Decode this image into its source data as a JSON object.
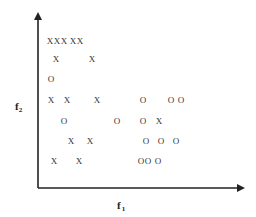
{
  "figure": {
    "x_axis_label": "f",
    "x_axis_subscript": "1",
    "y_axis_label": "f",
    "y_axis_subscript": "2"
  },
  "chart_data": {
    "type": "scatter",
    "title": "",
    "xlabel": "f1",
    "ylabel": "f2",
    "grid": false,
    "legend": "none",
    "axis_ticks": "none",
    "xlim": [
      0,
      10
    ],
    "ylim": [
      0,
      10
    ],
    "series": [
      {
        "name": "X",
        "marker": "x",
        "points": [
          {
            "x": 0.6,
            "y": 8.6
          },
          {
            "x": 1.0,
            "y": 8.6
          },
          {
            "x": 1.4,
            "y": 8.6
          },
          {
            "x": 2.3,
            "y": 8.6
          },
          {
            "x": 2.7,
            "y": 8.6
          },
          {
            "x": 1.0,
            "y": 7.6
          },
          {
            "x": 2.8,
            "y": 7.6
          },
          {
            "x": 0.7,
            "y": 5.4
          },
          {
            "x": 1.5,
            "y": 5.4
          },
          {
            "x": 3.0,
            "y": 5.4
          },
          {
            "x": 6.0,
            "y": 4.2
          },
          {
            "x": 1.7,
            "y": 3.0
          },
          {
            "x": 2.7,
            "y": 3.0
          },
          {
            "x": 0.9,
            "y": 1.9
          },
          {
            "x": 2.1,
            "y": 1.9
          }
        ]
      },
      {
        "name": "O",
        "marker": "o",
        "points": [
          {
            "x": 0.7,
            "y": 6.5
          },
          {
            "x": 5.3,
            "y": 5.4
          },
          {
            "x": 6.7,
            "y": 5.4
          },
          {
            "x": 7.2,
            "y": 5.4
          },
          {
            "x": 1.3,
            "y": 4.2
          },
          {
            "x": 4.0,
            "y": 4.2
          },
          {
            "x": 5.3,
            "y": 4.2
          },
          {
            "x": 5.4,
            "y": 3.0
          },
          {
            "x": 6.2,
            "y": 3.0
          },
          {
            "x": 6.9,
            "y": 3.0
          },
          {
            "x": 5.1,
            "y": 1.9
          },
          {
            "x": 5.5,
            "y": 1.9
          },
          {
            "x": 6.0,
            "y": 1.9
          }
        ]
      }
    ],
    "markers_px": [
      {
        "label": "x",
        "px": 50,
        "py": 44
      },
      {
        "label": "x",
        "px": 57,
        "py": 44
      },
      {
        "label": "x",
        "px": 64,
        "py": 44
      },
      {
        "label": "x",
        "px": 73,
        "py": 44
      },
      {
        "label": "x",
        "px": 80,
        "py": 44
      },
      {
        "label": "x",
        "px": 56,
        "py": 62
      },
      {
        "label": "x",
        "px": 92,
        "py": 62
      },
      {
        "label": "o",
        "px": 51,
        "py": 82
      },
      {
        "label": "x",
        "px": 51,
        "py": 103
      },
      {
        "label": "x",
        "px": 67,
        "py": 103
      },
      {
        "label": "x",
        "px": 97,
        "py": 103
      },
      {
        "label": "o",
        "px": 143,
        "py": 103
      },
      {
        "label": "o",
        "px": 171,
        "py": 103
      },
      {
        "label": "o",
        "px": 181,
        "py": 103
      },
      {
        "label": "o",
        "px": 64,
        "py": 124
      },
      {
        "label": "o",
        "px": 117,
        "py": 124
      },
      {
        "label": "o",
        "px": 143,
        "py": 124
      },
      {
        "label": "x",
        "px": 159,
        "py": 124
      },
      {
        "label": "x",
        "px": 71,
        "py": 144
      },
      {
        "label": "x",
        "px": 90,
        "py": 144
      },
      {
        "label": "o",
        "px": 146,
        "py": 144
      },
      {
        "label": "o",
        "px": 161,
        "py": 144
      },
      {
        "label": "o",
        "px": 176,
        "py": 144
      },
      {
        "label": "x",
        "px": 54,
        "py": 164
      },
      {
        "label": "x",
        "px": 79,
        "py": 164
      },
      {
        "label": "o",
        "px": 141,
        "py": 164
      },
      {
        "label": "o",
        "px": 148,
        "py": 164
      },
      {
        "label": "o",
        "px": 158,
        "py": 164
      }
    ]
  }
}
